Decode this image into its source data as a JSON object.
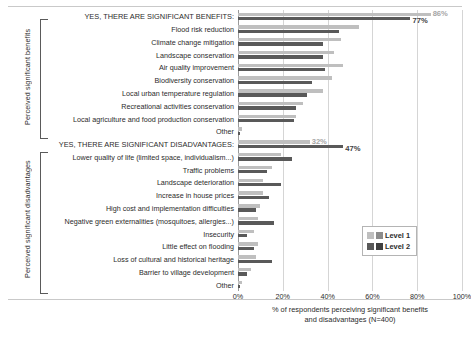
{
  "chart_data": {
    "type": "bar",
    "title": "",
    "xlabel": "% of respondents perceiving significant benefits and disadvantages (N=400)",
    "ylabel": "",
    "xlim": [
      0,
      100
    ],
    "xticks": [
      "0%",
      "20%",
      "40%",
      "60%",
      "80%",
      "100%"
    ],
    "grid": true,
    "legend_position": "middle-right",
    "orientation": "horizontal",
    "series": [
      {
        "name": "Level 1",
        "color": "#bfbfbf"
      },
      {
        "name": "Level 2",
        "color": "#595959"
      }
    ],
    "groups": [
      {
        "axis_title": "Perceived significant benefits",
        "rows": [
          {
            "label": "YES, THERE ARE SIGNIFICANT BENEFITS:",
            "header": true,
            "level1": 86,
            "level2": 77,
            "label1": "86%",
            "label2": "77%"
          },
          {
            "label": "Flood risk reduction",
            "header": false,
            "level1": 54,
            "level2": 45
          },
          {
            "label": "Climate change mitigation",
            "header": false,
            "level1": 46,
            "level2": 38
          },
          {
            "label": "Landscape conservation",
            "header": false,
            "level1": 43,
            "level2": 38
          },
          {
            "label": "Air quality improvement",
            "header": false,
            "level1": 47,
            "level2": 39
          },
          {
            "label": "Biodiversity conservation",
            "header": false,
            "level1": 42,
            "level2": 33
          },
          {
            "label": "Local urban temperature regulation",
            "header": false,
            "level1": 38,
            "level2": 31
          },
          {
            "label": "Recreational activities conservation",
            "header": false,
            "level1": 29,
            "level2": 26
          },
          {
            "label": "Local agriculture and food production conservation",
            "header": false,
            "level1": 26,
            "level2": 25
          },
          {
            "label": "Other",
            "header": false,
            "level1": 2,
            "level2": 1
          }
        ]
      },
      {
        "axis_title": "Perceived significant disadvantages",
        "rows": [
          {
            "label": "YES, THERE ARE SIGNIFICANT DISADVANTAGES:",
            "header": true,
            "level1": 32,
            "level2": 47,
            "label1": "32%",
            "label2": "47%"
          },
          {
            "label": "Lower quality of life (limited space, individualism...)",
            "header": false,
            "level1": 19,
            "level2": 24
          },
          {
            "label": "Traffic problems",
            "header": false,
            "level1": 15,
            "level2": 13
          },
          {
            "label": "Landscape deterioration",
            "header": false,
            "level1": 11,
            "level2": 19
          },
          {
            "label": "Increase in house prices",
            "header": false,
            "level1": 11,
            "level2": 14
          },
          {
            "label": "High cost and implementation difficulties",
            "header": false,
            "level1": 10,
            "level2": 8
          },
          {
            "label": "Negative green externalities (mosquitoes, allergies...)",
            "header": false,
            "level1": 9,
            "level2": 16
          },
          {
            "label": "Insecurity",
            "header": false,
            "level1": 7,
            "level2": 4
          },
          {
            "label": "Little effect on flooding",
            "header": false,
            "level1": 9,
            "level2": 7
          },
          {
            "label": "Loss of cultural and historical heritage",
            "header": false,
            "level1": 8,
            "level2": 15
          },
          {
            "label": "Barrier to village development",
            "header": false,
            "level1": 6,
            "level2": 4
          },
          {
            "label": "Other",
            "header": false,
            "level1": 2,
            "level2": 1
          }
        ]
      }
    ]
  },
  "legend": {
    "items": [
      {
        "label": "Level 1"
      },
      {
        "label": "Level 2"
      }
    ]
  },
  "xaxis": {
    "title_line1": "% of respondents perceiving significant benefits",
    "title_line2": "and disadvantages (N=400)"
  }
}
